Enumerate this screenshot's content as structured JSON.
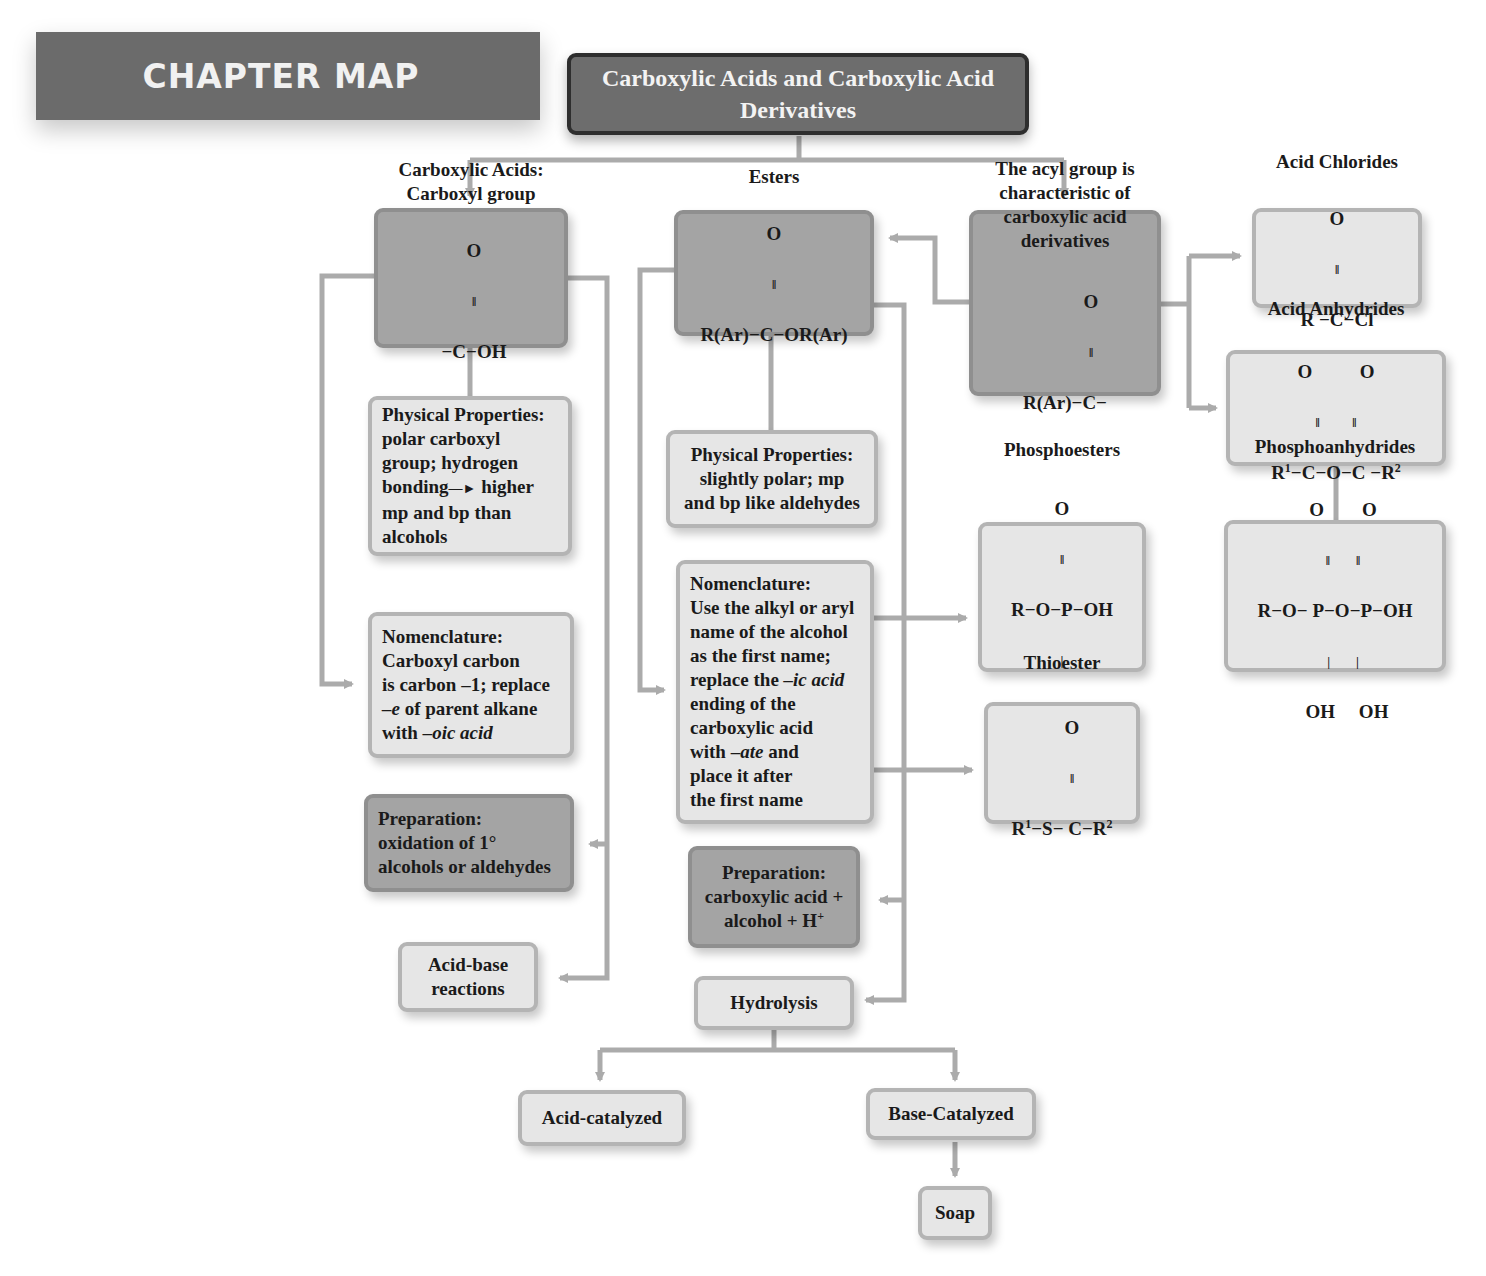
{
  "header": {
    "chapter_map_label": "CHAPTER MAP"
  },
  "title": {
    "line1": "Carboxylic Acids and Carboxylic Acid",
    "line2": "Derivatives"
  },
  "colors": {
    "dark_box": "#a4a4a4",
    "light_box": "#e6e6e6",
    "connector": "#ababab",
    "header_bg": "#6b6b6b",
    "title_bg": "#6d6d6d"
  },
  "carboxylic_acids": {
    "title1": "Carboxylic Acids:",
    "title2": "Carboxyl group",
    "formula": {
      "top": "O",
      "bond": "‖",
      "main": "−C−OH"
    }
  },
  "esters": {
    "title": "Esters",
    "formula": {
      "top": "O",
      "bond": "‖",
      "main": "R(Ar)−C−OR(Ar)"
    }
  },
  "acyl_group": {
    "lines": [
      "The acyl group is",
      "characteristic of",
      "carboxylic acid",
      "derivatives"
    ],
    "formula": {
      "top": "O",
      "bond": "‖",
      "main": "R(Ar)−C−"
    }
  },
  "acid_chlorides": {
    "title": "Acid Chlorides",
    "formula": {
      "top": "O",
      "bond": "‖",
      "main": "R −C−Cl"
    }
  },
  "acid_anhydrides": {
    "title": "Acid Anhydrides",
    "formula": {
      "top": "O          O",
      "bond": "‖          ‖",
      "main_r1": "R",
      "main_sup1": "1",
      "main_mid": "−C−O−C −R",
      "main_sup2": "2"
    }
  },
  "phosphoanhydrides": {
    "title": "Phosphoanhydrides",
    "formula": {
      "top": "O        O",
      "bond": "‖        ‖",
      "main": "R−O− P−O−P−OH",
      "down": "|        |",
      "bottom": "OH     OH"
    }
  },
  "phosphoesters": {
    "title": "Phosphoesters",
    "formula": {
      "top": "O",
      "bond": "‖",
      "main": "R−O−P−OH",
      "down": "|",
      "bottom": "OH"
    }
  },
  "thioester": {
    "title": "Thioester",
    "formula": {
      "top": "O",
      "bond": "‖",
      "r1": "R",
      "sup1": "1",
      "mid": "−S− C−R",
      "sup2": "2"
    }
  },
  "acid_physical": {
    "lines": [
      "Physical Properties:",
      "polar carboxyl",
      "group; hydrogen",
      "bonding",
      "higher",
      "mp and bp than",
      "alcohols"
    ],
    "arrow_glyph": "—►"
  },
  "ester_physical": {
    "lines": [
      "Physical Properties:",
      "slightly polar; mp",
      "and bp like aldehydes"
    ]
  },
  "acid_nomenclature": {
    "line1": "Nomenclature:",
    "line2": "Carboxyl carbon",
    "line3": "is carbon –1; replace",
    "line4_it": "–e",
    "line4_rest": " of parent alkane",
    "line5_pre": "with ",
    "line5_it": "–oic acid"
  },
  "ester_nomenclature": {
    "line1": "Nomenclature:",
    "line2": "Use the alkyl or aryl",
    "line3": "name of the alcohol",
    "line4": "as the first name;",
    "line5_pre": "replace the ",
    "line5_it": "–ic acid",
    "line6": "ending of the",
    "line7": "carboxylic acid",
    "line8_pre": "with –",
    "line8_it": "ate",
    "line8_post": " and",
    "line9": "place it after",
    "line10": "the first name"
  },
  "acid_preparation": {
    "lines": [
      "Preparation:",
      "oxidation of 1°",
      "alcohols or aldehydes"
    ]
  },
  "ester_preparation": {
    "line1": "Preparation:",
    "line2": "carboxylic acid +",
    "line3_pre": "alcohol + H",
    "line3_sup": "+"
  },
  "acid_base": {
    "line1": "Acid-base",
    "line2": "reactions"
  },
  "hydrolysis": {
    "label": "Hydrolysis"
  },
  "acid_catalyzed": {
    "label": "Acid-catalyzed"
  },
  "base_catalyzed": {
    "label": "Base-Catalyzed"
  },
  "soap": {
    "label": "Soap"
  }
}
